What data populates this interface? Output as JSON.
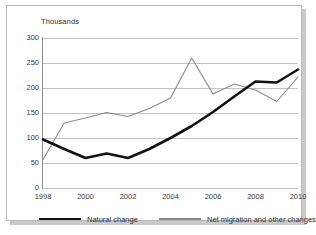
{
  "chart_data": {
    "type": "line",
    "title": "",
    "subtitle": "",
    "unit_label": "Thousands",
    "xlabel": "",
    "ylabel": "",
    "x": [
      1998,
      1999,
      2000,
      2001,
      2002,
      2003,
      2004,
      2005,
      2006,
      2007,
      2008,
      2009,
      2010
    ],
    "categories": [
      "1998",
      "1999",
      "2000",
      "2001",
      "2002",
      "2003",
      "2004",
      "2005",
      "2006",
      "2007",
      "2008",
      "2009",
      "2010"
    ],
    "xtick_labels": [
      "1998",
      "2000",
      "2002",
      "2004",
      "2006",
      "2008",
      "2010"
    ],
    "ytick_labels": [
      "0",
      "50",
      "100",
      "150",
      "200",
      "250",
      "300"
    ],
    "ylim": [
      0,
      300
    ],
    "xlim": [
      1998,
      2010
    ],
    "grid": true,
    "legend_position": "bottom",
    "series": [
      {
        "name": "Natural change",
        "color": "#121212",
        "width": "thick",
        "values": [
          97,
          78,
          60,
          69,
          60,
          78,
          100,
          124,
          152,
          183,
          213,
          211,
          237
        ]
      },
      {
        "name": "Net migration and other changes",
        "color": "#8a8a8a",
        "width": "thin",
        "values": [
          57,
          130,
          140,
          151,
          143,
          159,
          180,
          260,
          188,
          208,
          196,
          173,
          222
        ]
      }
    ]
  },
  "legend": {
    "natural_label": "Natural change",
    "migration_label": "Net migration and other changes"
  }
}
